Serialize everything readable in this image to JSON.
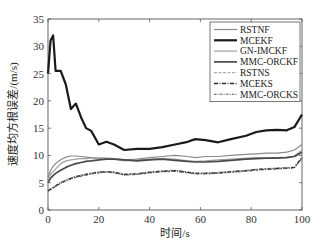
{
  "chart_data": {
    "type": "line",
    "title": "",
    "xlabel": "时间/s",
    "ylabel": "速度均方根误差/(m/s)",
    "xlim": [
      0,
      100
    ],
    "ylim": [
      0,
      35
    ],
    "xticks": [
      0,
      20,
      40,
      60,
      80,
      100
    ],
    "yticks": [
      0,
      5,
      10,
      15,
      20,
      25,
      30,
      35
    ],
    "grid": false,
    "legend_position": "upper right",
    "x": [
      0,
      1,
      2,
      3,
      5,
      7,
      9,
      11,
      13,
      15,
      17,
      20,
      23,
      26,
      30,
      35,
      40,
      45,
      50,
      55,
      58,
      62,
      67,
      72,
      78,
      82,
      86,
      90,
      94,
      97,
      100
    ],
    "series": [
      {
        "name": "RSTNF",
        "style": "solid-thin",
        "color": "#8a8a8a",
        "width": 1.2,
        "values": [
          6.0,
          7.2,
          8.0,
          8.5,
          9.2,
          9.7,
          9.9,
          9.9,
          9.8,
          9.7,
          9.6,
          9.5,
          9.5,
          9.4,
          9.2,
          9.3,
          9.6,
          9.8,
          10.0,
          9.8,
          9.6,
          9.8,
          9.8,
          10.0,
          10.2,
          10.3,
          10.4,
          10.4,
          10.6,
          11.0,
          12.0
        ]
      },
      {
        "name": "MCEKF",
        "style": "solid-thick",
        "color": "#1a1a1a",
        "width": 2.2,
        "values": [
          25.0,
          31.0,
          32.0,
          25.5,
          25.5,
          23.0,
          18.5,
          19.5,
          17.0,
          15.0,
          14.5,
          12.0,
          12.5,
          12.0,
          11.0,
          11.2,
          11.2,
          11.5,
          12.0,
          12.5,
          13.0,
          12.8,
          12.4,
          13.0,
          13.6,
          14.3,
          14.6,
          14.7,
          14.6,
          15.2,
          17.5
        ]
      },
      {
        "name": "GN-IMCKF",
        "style": "solid-thin",
        "color": "#a0a0a0",
        "width": 1.2,
        "values": [
          5.5,
          6.5,
          7.0,
          7.5,
          8.5,
          9.0,
          9.2,
          9.3,
          9.4,
          9.4,
          9.5,
          9.5,
          9.4,
          9.3,
          9.0,
          9.2,
          9.3,
          9.4,
          9.3,
          9.0,
          8.9,
          9.0,
          9.2,
          9.3,
          9.5,
          9.6,
          9.5,
          9.6,
          9.7,
          9.9,
          11.0
        ]
      },
      {
        "name": "MMC-ORCKF",
        "style": "solid-medium",
        "color": "#4a4a4a",
        "width": 1.7,
        "values": [
          5.0,
          5.8,
          6.3,
          6.7,
          7.3,
          7.8,
          8.2,
          8.5,
          8.7,
          8.9,
          9.0,
          9.2,
          9.3,
          9.3,
          9.2,
          9.0,
          9.2,
          9.3,
          9.1,
          8.9,
          8.8,
          8.8,
          8.9,
          9.1,
          9.3,
          9.4,
          9.5,
          9.5,
          9.6,
          9.8,
          10.6
        ]
      },
      {
        "name": "RSTNS",
        "style": "dashed",
        "color": "#9a9a9a",
        "width": 1.0,
        "values": [
          3.6,
          3.9,
          4.2,
          4.5,
          5.1,
          5.5,
          5.9,
          6.2,
          6.4,
          6.6,
          6.8,
          7.0,
          7.1,
          7.0,
          6.6,
          6.7,
          7.0,
          7.2,
          7.3,
          7.0,
          6.8,
          6.8,
          6.9,
          7.1,
          7.3,
          7.5,
          7.6,
          7.7,
          7.8,
          7.9,
          9.7
        ]
      },
      {
        "name": "MCEKS",
        "style": "dash-dot",
        "color": "#2a2a2a",
        "width": 1.3,
        "values": [
          3.5,
          3.8,
          4.1,
          4.4,
          5.0,
          5.4,
          5.8,
          6.1,
          6.3,
          6.5,
          6.7,
          6.9,
          7.0,
          6.9,
          6.5,
          6.6,
          6.9,
          7.1,
          7.2,
          6.9,
          6.7,
          6.7,
          6.8,
          7.0,
          7.2,
          7.4,
          7.5,
          7.6,
          7.7,
          7.8,
          9.6
        ]
      },
      {
        "name": "MMC-ORCKS",
        "style": "dashed-dot",
        "color": "#555555",
        "width": 1.1,
        "values": [
          3.4,
          3.7,
          4.0,
          4.3,
          4.9,
          5.3,
          5.7,
          6.0,
          6.2,
          6.4,
          6.6,
          6.8,
          6.9,
          6.8,
          6.4,
          6.5,
          6.8,
          7.0,
          7.1,
          6.8,
          6.6,
          6.6,
          6.7,
          6.9,
          7.1,
          7.3,
          7.4,
          7.5,
          7.6,
          7.7,
          9.5
        ]
      }
    ]
  },
  "labels": {
    "xlabel": "时间/s",
    "ylabel": "速度均方根误差/(m/s)"
  }
}
